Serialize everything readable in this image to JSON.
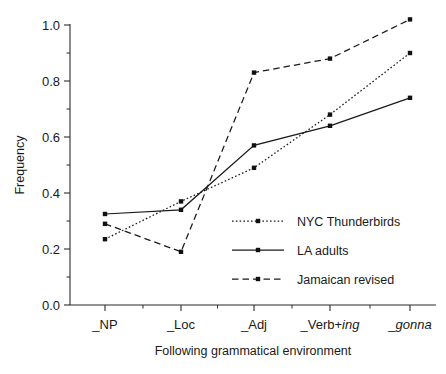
{
  "chart_data": {
    "type": "line",
    "title": "",
    "xlabel": "Following grammatical environment",
    "ylabel": "Frequency",
    "categories": [
      "_NP",
      "_Loc",
      "_Adj",
      "_Verb+ing",
      "_gonna"
    ],
    "category_labels_plain": [
      "_NP",
      "_Loc",
      "_Adj",
      "_Verb+",
      "_"
    ],
    "category_labels_italic": [
      "",
      "",
      "",
      "ing",
      "gonna"
    ],
    "ylim": [
      0.0,
      1.05
    ],
    "ytick_labels": [
      "0.0",
      "0.2",
      "0.4",
      "0.6",
      "0.8",
      "1.0"
    ],
    "ytick_values": [
      0.0,
      0.2,
      0.4,
      0.6,
      0.8,
      1.0
    ],
    "grid": false,
    "legend_position": "center-right",
    "series": [
      {
        "name": "NYC Thunderbirds",
        "style": "dotted",
        "values": [
          0.235,
          0.37,
          0.49,
          0.68,
          0.9
        ]
      },
      {
        "name": "LA adults",
        "style": "solid",
        "values": [
          0.325,
          0.34,
          0.57,
          0.64,
          0.74
        ]
      },
      {
        "name": "Jamaican revised",
        "style": "dashed",
        "values": [
          0.29,
          0.19,
          0.83,
          0.88,
          1.02
        ]
      }
    ]
  },
  "legend": {
    "entries": [
      {
        "label": "NYC Thunderbirds",
        "style": "dotted"
      },
      {
        "label": "LA adults",
        "style": "solid"
      },
      {
        "label": "Jamaican revised",
        "style": "dashed"
      }
    ]
  },
  "axes": {
    "y_title": "Frequency",
    "x_title": "Following grammatical environment"
  }
}
